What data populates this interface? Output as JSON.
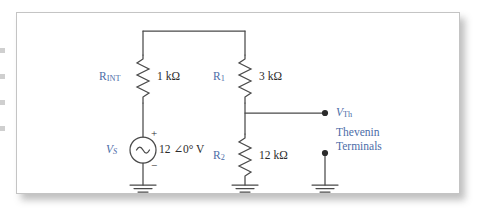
{
  "figure": {
    "type": "schematic-circuit-diagram",
    "colors": {
      "label_blue": "#4c6da8",
      "value_text": "#2b2b2b",
      "wire": "#4a4a4a",
      "frame_border": "#c4c4c4",
      "background": "#ffffff"
    }
  },
  "components": {
    "r_int": {
      "designator": "R",
      "designator_sub": "INT",
      "value": "1 kΩ"
    },
    "r1": {
      "designator": "R",
      "designator_sub": "1",
      "value": "3 kΩ"
    },
    "r2": {
      "designator": "R",
      "designator_sub": "2",
      "value": "12 kΩ"
    },
    "source": {
      "designator": "V",
      "designator_sub": "S",
      "value": "12 ∠0° V",
      "polarity_positive": "+",
      "polarity_negative": "−",
      "symbol": "ac-sine-source"
    }
  },
  "terminals": {
    "vth_label": "V",
    "vth_sub": "Th",
    "caption_line1": "Thevenin",
    "caption_line2": "Terminals"
  },
  "grounds": {
    "count": 3,
    "symbol": "earth-ground"
  }
}
